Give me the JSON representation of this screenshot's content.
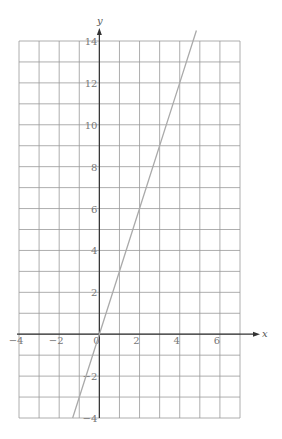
{
  "chart_data": {
    "type": "line",
    "title": "",
    "xlabel": "x",
    "ylabel": "y",
    "xlim": [
      -4,
      7
    ],
    "ylim": [
      -4,
      14
    ],
    "grid": true,
    "x_ticks": [
      "-4",
      "-2",
      "0",
      "2",
      "4",
      "6"
    ],
    "y_ticks": [
      "-4",
      "-2",
      "2",
      "4",
      "6",
      "8",
      "10",
      "12",
      "14"
    ],
    "series": [
      {
        "name": "y = 3x",
        "x": [
          -1.33,
          0,
          2,
          4,
          4.83
        ],
        "y": [
          -4,
          0,
          6,
          12,
          14.5
        ]
      }
    ],
    "line_color": "#aaaaaa",
    "grid_color": "#999999"
  }
}
